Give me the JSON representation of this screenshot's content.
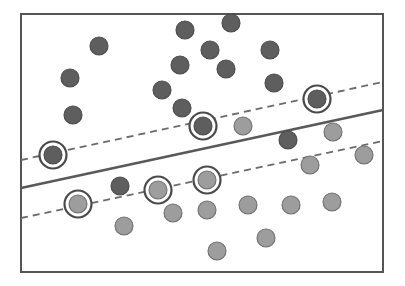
{
  "figure": {
    "type": "scatter-with-decision-boundary",
    "width": 405,
    "height": 286
  },
  "colors": {
    "background": "#ffffff",
    "frame_stroke": "#555555",
    "class_a_fill": "#5e5e5e",
    "class_a_stroke": "#4a4a4a",
    "class_b_fill": "#9d9d9d",
    "class_b_stroke": "#6e6e6e",
    "decision_line": "#595959",
    "margin_line": "#6b6b6b",
    "support_ring": "#4a4a4a"
  },
  "frame": {
    "x": 21,
    "y": 14,
    "width": 362,
    "height": 258,
    "stroke_width": 2
  },
  "lines": {
    "decision_boundary": {
      "label": "decision-boundary",
      "style": "solid",
      "stroke_width": 2.6,
      "x1": 21,
      "y1": 188,
      "x2": 383,
      "y2": 110
    },
    "margin_upper": {
      "label": "margin-upper",
      "style": "dashed",
      "stroke_width": 1.8,
      "dash": "7 5",
      "x1": 21,
      "y1": 160,
      "x2": 383,
      "y2": 82
    },
    "margin_lower": {
      "label": "margin-lower",
      "style": "dashed",
      "stroke_width": 1.8,
      "dash": "7 5",
      "x1": 21,
      "y1": 218,
      "x2": 383,
      "y2": 141
    }
  },
  "legend_classes": [
    {
      "key": "class_a",
      "name": "dark-class",
      "marker": "filled-dark-circle"
    },
    {
      "key": "class_b",
      "name": "light-class",
      "marker": "filled-light-circle"
    },
    {
      "key": "support_vector",
      "name": "support-vector",
      "marker": "circled-point"
    }
  ],
  "chart_data": {
    "type": "scatter",
    "xlabel": "",
    "ylabel": "",
    "xlim": [
      21,
      383
    ],
    "ylim": [
      14,
      272
    ],
    "grid": false,
    "legend_position": "none",
    "annotations": [
      "solid line = decision boundary",
      "dashed lines = margins",
      "ringed points = support vectors"
    ],
    "series": [
      {
        "name": "dark-class",
        "class_key": "class_a",
        "radius": 9,
        "points": [
          {
            "x": 99,
            "y": 46,
            "support": false
          },
          {
            "x": 185,
            "y": 30,
            "support": false
          },
          {
            "x": 231,
            "y": 23,
            "support": false
          },
          {
            "x": 210,
            "y": 50,
            "support": false
          },
          {
            "x": 270,
            "y": 50,
            "support": false
          },
          {
            "x": 70,
            "y": 78,
            "support": false
          },
          {
            "x": 180,
            "y": 65,
            "support": false
          },
          {
            "x": 226,
            "y": 69,
            "support": false
          },
          {
            "x": 274,
            "y": 83,
            "support": false
          },
          {
            "x": 162,
            "y": 90,
            "support": false
          },
          {
            "x": 73,
            "y": 115,
            "support": false
          },
          {
            "x": 182,
            "y": 108,
            "support": false
          },
          {
            "x": 317,
            "y": 99,
            "support": true
          },
          {
            "x": 203,
            "y": 126,
            "support": true
          },
          {
            "x": 53,
            "y": 155,
            "support": true
          },
          {
            "x": 288,
            "y": 140,
            "support": false
          },
          {
            "x": 120,
            "y": 186,
            "support": false
          }
        ]
      },
      {
        "name": "light-class",
        "class_key": "class_b",
        "radius": 9,
        "points": [
          {
            "x": 243,
            "y": 126,
            "support": false
          },
          {
            "x": 333,
            "y": 132,
            "support": false
          },
          {
            "x": 364,
            "y": 155,
            "support": false
          },
          {
            "x": 310,
            "y": 165,
            "support": false
          },
          {
            "x": 207,
            "y": 180,
            "support": true
          },
          {
            "x": 158,
            "y": 190,
            "support": true
          },
          {
            "x": 78,
            "y": 204,
            "support": true
          },
          {
            "x": 173,
            "y": 213,
            "support": false
          },
          {
            "x": 207,
            "y": 210,
            "support": false
          },
          {
            "x": 248,
            "y": 205,
            "support": false
          },
          {
            "x": 291,
            "y": 205,
            "support": false
          },
          {
            "x": 332,
            "y": 202,
            "support": false
          },
          {
            "x": 124,
            "y": 226,
            "support": false
          },
          {
            "x": 266,
            "y": 238,
            "support": false
          },
          {
            "x": 217,
            "y": 251,
            "support": false
          }
        ]
      }
    ]
  }
}
